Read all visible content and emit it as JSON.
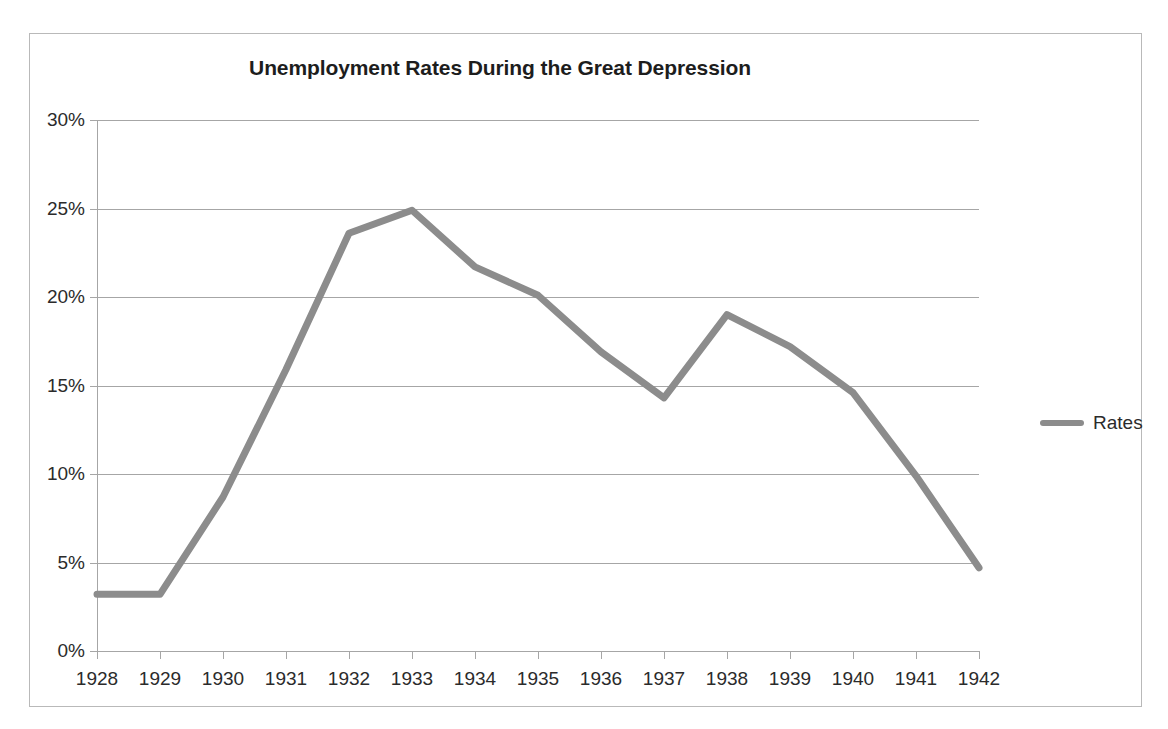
{
  "chart_data": {
    "type": "line",
    "title": "Unemployment Rates During the Great Depression",
    "xlabel": "",
    "ylabel": "",
    "categories": [
      "1928",
      "1929",
      "1930",
      "1931",
      "1932",
      "1933",
      "1934",
      "1935",
      "1936",
      "1937",
      "1938",
      "1939",
      "1940",
      "1941",
      "1942"
    ],
    "series": [
      {
        "name": "Rates",
        "color": "#8c8c8c",
        "values": [
          3.2,
          3.2,
          8.7,
          15.9,
          23.6,
          24.9,
          21.7,
          20.1,
          16.9,
          14.3,
          19.0,
          17.2,
          14.6,
          9.9,
          4.7
        ]
      }
    ],
    "ylim": [
      0,
      30
    ],
    "ytick_values": [
      0,
      5,
      10,
      15,
      20,
      25,
      30
    ],
    "ytick_labels": [
      "0%",
      "5%",
      "10%",
      "15%",
      "20%",
      "25%",
      "30%"
    ],
    "grid": true,
    "legend_position": "right",
    "line_width": 7,
    "grid_color": "#a6a6a6",
    "border_color": "#b9b9b9"
  },
  "legend": {
    "entries": [
      {
        "label": "Rates",
        "swatch_name": "legend-swatch-rates"
      }
    ]
  }
}
